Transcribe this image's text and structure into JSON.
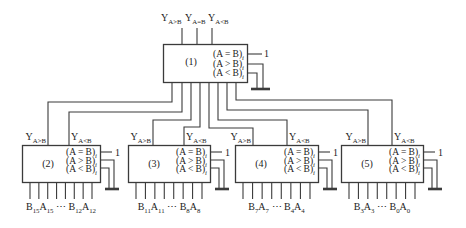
{
  "labels": {
    "one": "1",
    "y_gt": [
      [
        "Y",
        "A>B"
      ]
    ],
    "y_eq": [
      [
        "Y",
        "A=B"
      ]
    ],
    "y_lt": [
      [
        "Y",
        "A<B"
      ]
    ],
    "in_eq": [
      [
        "(A = B)",
        "i"
      ]
    ],
    "in_gt": [
      [
        "(A > B)",
        "i"
      ]
    ],
    "in_lt": [
      [
        "(A < B)",
        "i"
      ]
    ]
  },
  "comparators": {
    "c1": {
      "id": "(1)"
    },
    "c2": {
      "id": "(2)",
      "bits": [
        [
          "B",
          "15"
        ],
        [
          "A",
          "15"
        ],
        [
          " ⋯ ",
          ""
        ],
        [
          "B",
          "12"
        ],
        [
          "A",
          "12"
        ]
      ]
    },
    "c3": {
      "id": "(3)",
      "bits": [
        [
          "B",
          "11"
        ],
        [
          "A",
          "11"
        ],
        [
          " ⋯ ",
          ""
        ],
        [
          "B",
          "8"
        ],
        [
          "A",
          "8"
        ]
      ]
    },
    "c4": {
      "id": "(4)",
      "bits": [
        [
          "B",
          "7"
        ],
        [
          "A",
          "7"
        ],
        [
          " ⋯ ",
          ""
        ],
        [
          "B",
          "4"
        ],
        [
          "A",
          "4"
        ]
      ]
    },
    "c5": {
      "id": "(5)",
      "bits": [
        [
          "B",
          "3"
        ],
        [
          "A",
          "3"
        ],
        [
          " ⋯ ",
          ""
        ],
        [
          "B",
          "0"
        ],
        [
          "A",
          "0"
        ]
      ]
    }
  },
  "colors": {
    "line": "#3b3b3b",
    "text": "#1c1c1c",
    "background": "#ffffff"
  }
}
